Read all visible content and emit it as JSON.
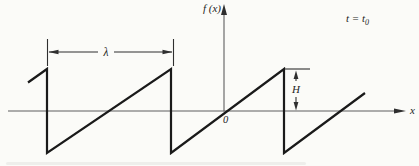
{
  "figure": {
    "function_label": "f (x)",
    "time_label": {
      "prefix": "t = t",
      "sub": "0"
    },
    "wavelength_label": "λ",
    "height_label": "H",
    "origin_label": "0",
    "x_axis_label": "x"
  },
  "waveform": {
    "type": "sawtooth",
    "points": "28,82.5 47,69 47,153 171,69 171,153 284,69 284,153 365,93"
  },
  "colors": {
    "background": "#fbfbf8",
    "waveform_stroke": "#1a1a1a",
    "axis_stroke": "#5f5f5f",
    "dimension_stroke": "#2f2f2f",
    "text": "#1d1d1d"
  }
}
